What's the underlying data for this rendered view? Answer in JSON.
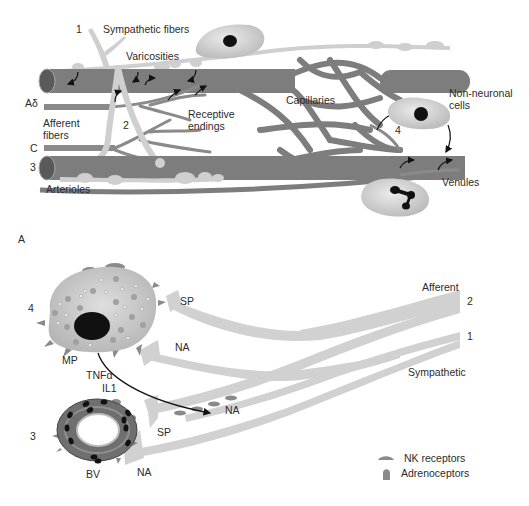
{
  "panel_a": {
    "labels": {
      "sympathetic_fibers": "Sympathetic fibers",
      "varicosities": "Varicosities",
      "a_delta": "Aδ",
      "afferent_fibers_1": "Afferent",
      "afferent_fibers_2": "fibers",
      "c_fiber": "C",
      "receptive_endings_1": "Receptive",
      "receptive_endings_2": "endings",
      "capillaries": "Capillaries",
      "non_neuronal_1": "Non-neuronal",
      "non_neuronal_2": "cells",
      "venules": "Venules",
      "arterioles": "Arterioles"
    },
    "numbers": {
      "n1": "1",
      "n2": "2",
      "n3": "3",
      "n4": "4"
    },
    "panel_letter": "A"
  },
  "panel_b": {
    "labels": {
      "sp_top": "SP",
      "na_top": "NA",
      "mp": "MP",
      "tnf": "TNFα",
      "il1": "IL1",
      "na_mid": "NA",
      "sp_bottom": "SP",
      "bv": "BV",
      "na_bottom": "NA",
      "afferent": "Afferent",
      "sympathetic": "Sympathetic"
    },
    "numbers": {
      "n4": "4",
      "n3": "3",
      "n2": "2",
      "n1": "1"
    },
    "legend": [
      {
        "label": "NK receptors",
        "shape": "flat-dome"
      },
      {
        "label": "Adrenoceptors",
        "shape": "tall-dome"
      }
    ]
  },
  "colors": {
    "vessel": "#7d7d7d",
    "vessel_end": "#5a5a5a",
    "nerve": "#cfcfcf",
    "cell": "#d9d9d9",
    "nucleus": "#111111",
    "receptor": "#8a8a8a",
    "text": "#2b2b2b"
  }
}
